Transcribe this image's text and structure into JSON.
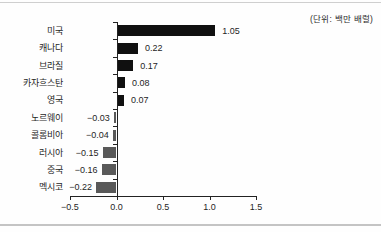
{
  "chart_data": {
    "type": "bar",
    "orientation": "horizontal",
    "title": "",
    "unit_note": "(단위: 백만 배럴)",
    "categories": [
      "미국",
      "캐나다",
      "브라질",
      "카자흐스탄",
      "영국",
      "노르웨이",
      "콜롬비아",
      "러시아",
      "중국",
      "멕시코"
    ],
    "values": [
      1.05,
      0.22,
      0.17,
      0.08,
      0.07,
      -0.03,
      -0.04,
      -0.15,
      -0.16,
      -0.22
    ],
    "value_labels": [
      "1.05",
      "0.22",
      "0.17",
      "0.08",
      "0.07",
      "−0.03",
      "−0.04",
      "−0.15",
      "−0.16",
      "−0.22"
    ],
    "x_ticks": [
      -0.5,
      0.0,
      0.5,
      1.0,
      1.5
    ],
    "x_tick_labels": [
      "−0.5",
      "0.0",
      "0.5",
      "1.0",
      "1.5"
    ],
    "xlim": [
      -0.5,
      1.5
    ],
    "grid": false,
    "legend": "none",
    "positive_bar_color": "#101010",
    "negative_bar_color": "#595959",
    "axis_color": "#222222"
  }
}
